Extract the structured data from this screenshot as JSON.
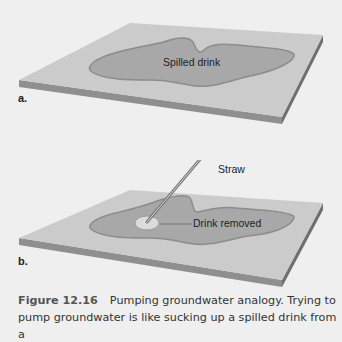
{
  "figure": {
    "panel_a": {
      "letter": "a.",
      "spill_label": "Spilled drink"
    },
    "panel_b": {
      "letter": "b.",
      "straw_label": "Straw",
      "removed_label": "Drink removed"
    },
    "caption": {
      "number": "Figure 12.16",
      "text": "Pumping groundwater analogy. Trying to pump groundwater is like sucking up a spilled drink from a"
    },
    "colors": {
      "background": "#efefef",
      "board_top": "#c9c9c9",
      "board_edge": "#8f8f8f",
      "spill": "#a9a9a9",
      "spill_rim": "#8a8a8a",
      "removed": "#dedede"
    }
  }
}
